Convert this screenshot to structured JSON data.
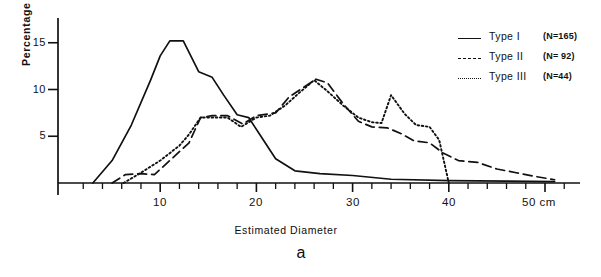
{
  "figure": {
    "caption": "a"
  },
  "axes": {
    "ylabel": "Percentage",
    "xlabel": "Estimated  Diameter",
    "x_unit": "cm",
    "y_ticks": [
      "5",
      "10",
      "15"
    ],
    "x_ticks": [
      "10",
      "20",
      "30",
      "40",
      "50"
    ],
    "x_last_label": "50 cm"
  },
  "legend": {
    "items": [
      {
        "label": "Type I",
        "n": "(N=165)",
        "style": "solid"
      },
      {
        "label": "Type II",
        "n": "(N= 92)",
        "style": "dashed"
      },
      {
        "label": "Type III",
        "n": "(N=44)",
        "style": "dotted"
      }
    ]
  },
  "colors": {
    "ink": "#111111",
    "background": "#ffffff"
  },
  "chart_data": {
    "type": "line",
    "title": "",
    "subtitle": "",
    "xlabel": "Estimated Diameter",
    "ylabel": "Percentage",
    "xlim": [
      0,
      52
    ],
    "ylim": [
      0,
      16.5
    ],
    "x_unit": "cm",
    "grid": false,
    "legend_position": "top-right",
    "y_ticks": [
      5,
      10,
      15
    ],
    "x_ticks": [
      10,
      20,
      30,
      40,
      50
    ],
    "x_minor_tick_step": 2,
    "series": [
      {
        "name": "Type I",
        "n": 165,
        "style": "solid",
        "points": [
          [
            3.0,
            0.0
          ],
          [
            5.0,
            2.4
          ],
          [
            7.0,
            6.2
          ],
          [
            9.0,
            11.0
          ],
          [
            10.0,
            13.6
          ],
          [
            11.0,
            15.2
          ],
          [
            12.4,
            15.2
          ],
          [
            14.0,
            11.9
          ],
          [
            15.4,
            11.3
          ],
          [
            16.6,
            9.4
          ],
          [
            18.0,
            7.3
          ],
          [
            19.2,
            7.0
          ],
          [
            20.4,
            5.1
          ],
          [
            22.0,
            2.6
          ],
          [
            24.0,
            1.3
          ],
          [
            26.6,
            1.0
          ],
          [
            30.0,
            0.8
          ],
          [
            34.0,
            0.4
          ],
          [
            40.0,
            0.25
          ],
          [
            46.0,
            0.2
          ],
          [
            51.0,
            0.15
          ]
        ]
      },
      {
        "name": "Type II",
        "n": 92,
        "style": "dashed",
        "points": [
          [
            5.0,
            0.0
          ],
          [
            6.4,
            0.9
          ],
          [
            8.0,
            1.0
          ],
          [
            9.4,
            0.9
          ],
          [
            11.0,
            2.4
          ],
          [
            13.0,
            4.3
          ],
          [
            14.2,
            7.0
          ],
          [
            15.4,
            7.2
          ],
          [
            17.0,
            7.2
          ],
          [
            18.6,
            6.3
          ],
          [
            20.0,
            7.2
          ],
          [
            22.0,
            7.5
          ],
          [
            23.4,
            9.2
          ],
          [
            25.0,
            10.3
          ],
          [
            26.2,
            11.1
          ],
          [
            27.4,
            10.7
          ],
          [
            29.0,
            8.5
          ],
          [
            30.6,
            6.6
          ],
          [
            32.0,
            6.0
          ],
          [
            33.6,
            5.9
          ],
          [
            35.0,
            5.3
          ],
          [
            36.4,
            4.5
          ],
          [
            38.0,
            4.3
          ],
          [
            39.4,
            3.2
          ],
          [
            41.0,
            2.4
          ],
          [
            43.0,
            2.2
          ],
          [
            45.0,
            1.5
          ],
          [
            47.0,
            1.1
          ],
          [
            49.0,
            0.7
          ],
          [
            51.0,
            0.35
          ]
        ]
      },
      {
        "name": "Type III",
        "n": 44,
        "style": "dotted",
        "points": [
          [
            6.2,
            0.0
          ],
          [
            8.0,
            1.1
          ],
          [
            10.0,
            2.4
          ],
          [
            12.0,
            4.0
          ],
          [
            13.0,
            5.2
          ],
          [
            14.2,
            7.0
          ],
          [
            17.0,
            7.0
          ],
          [
            18.4,
            6.0
          ],
          [
            20.0,
            7.0
          ],
          [
            21.4,
            7.2
          ],
          [
            23.0,
            8.3
          ],
          [
            24.4,
            9.6
          ],
          [
            26.0,
            11.0
          ],
          [
            27.4,
            9.8
          ],
          [
            29.0,
            8.3
          ],
          [
            30.6,
            7.0
          ],
          [
            32.0,
            6.5
          ],
          [
            33.0,
            6.4
          ],
          [
            34.0,
            9.4
          ],
          [
            35.4,
            7.4
          ],
          [
            36.6,
            6.2
          ],
          [
            38.0,
            6.0
          ],
          [
            39.0,
            4.6
          ],
          [
            40.0,
            0.0
          ]
        ]
      }
    ]
  }
}
